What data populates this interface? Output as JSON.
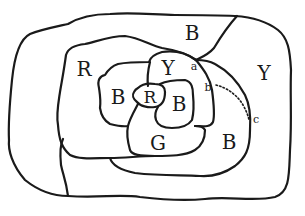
{
  "figure": {
    "regions": [
      {
        "id": "outer-B",
        "label": "B",
        "x": 192,
        "y": 32
      },
      {
        "id": "outer-R",
        "label": "R",
        "x": 84,
        "y": 69
      },
      {
        "id": "outer-Y",
        "label": "Y",
        "x": 264,
        "y": 72
      },
      {
        "id": "inner-Y",
        "label": "Y",
        "x": 168,
        "y": 69
      },
      {
        "id": "inner-B-left",
        "label": "B",
        "x": 118,
        "y": 97
      },
      {
        "id": "center-R",
        "label": "R",
        "x": 151,
        "y": 97
      },
      {
        "id": "center-B",
        "label": "B",
        "x": 179,
        "y": 104
      },
      {
        "id": "inner-G",
        "label": "G",
        "x": 158,
        "y": 143
      },
      {
        "id": "lower-B",
        "label": "B",
        "x": 229,
        "y": 142
      }
    ],
    "points": [
      {
        "id": "a",
        "label": "a",
        "x": 194,
        "y": 66
      },
      {
        "id": "b",
        "label": "b",
        "x": 209,
        "y": 87
      },
      {
        "id": "c",
        "label": "c",
        "x": 256,
        "y": 119
      }
    ],
    "line_color": "#1a1a1a",
    "background": "#ffffff"
  }
}
